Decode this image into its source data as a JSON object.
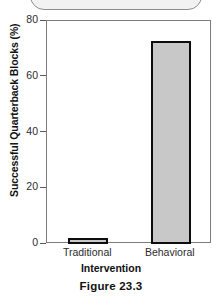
{
  "page": {
    "background_color": "#ffffff",
    "top_cut_shape": {
      "name": "rounded-box-cutoff",
      "border_color": "#8e8e8e",
      "fill_color": "#f2f2f2"
    }
  },
  "caption": {
    "text": "Figure 23.3"
  },
  "chart_data": {
    "type": "bar",
    "title": "",
    "categories": [
      "Traditional",
      "Behavioral"
    ],
    "values": [
      2,
      73
    ],
    "series": [
      {
        "name": "Successful Quarterback Blocks",
        "values": [
          2,
          73
        ]
      }
    ],
    "xlabel": "Intervention",
    "ylabel": "Successful Quarterback Blocks (%)",
    "ylim": [
      0,
      80
    ],
    "yticks": [
      0,
      20,
      40,
      60,
      80
    ],
    "ytick_labels": [
      "0",
      "20",
      "40",
      "60",
      "80"
    ],
    "grid": false,
    "legend": false,
    "legend_position": "none",
    "bar_fill_color": "#c8c8c8",
    "bar_border_color": "#0d0d0d",
    "axis_color": "#7c7c7c"
  }
}
